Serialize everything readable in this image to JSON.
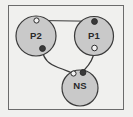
{
  "diagram": {
    "frame": {
      "x": 8.5,
      "y": 5.5,
      "width": 115,
      "height": 104,
      "stroke_color": "#6b6b6b",
      "fill_color": "#f0f0ee"
    },
    "style": {
      "node_fill": "#c9c9c9",
      "node_stroke": "#3a3a3a",
      "port_open_fill": "#f2f2f2",
      "port_filled_fill": "#3a3a3a",
      "port_stroke": "#2d2d2d",
      "edge_color": "#3a3a3a",
      "label_color": "#2a2a2a"
    },
    "nodes": [
      {
        "id": "p2",
        "label": "P2",
        "cx": 36,
        "cy": 36,
        "r": 20,
        "ports": [
          {
            "id": "p2-top-port",
            "type": "open",
            "cx": 36.5,
            "cy": 20.5,
            "r": 2.6
          },
          {
            "id": "p2-bottom-port",
            "type": "filled",
            "cx": 42.5,
            "cy": 48.5,
            "r": 2.9
          }
        ]
      },
      {
        "id": "p1",
        "label": "P1",
        "cx": 94,
        "cy": 36,
        "r": 19.5,
        "ports": [
          {
            "id": "p1-top-port",
            "type": "filled",
            "cx": 94.5,
            "cy": 21.5,
            "r": 2.9
          },
          {
            "id": "p1-bottom-port",
            "type": "open",
            "cx": 94.5,
            "cy": 48.0,
            "r": 2.8
          }
        ]
      },
      {
        "id": "ns",
        "label": "NS",
        "cx": 80,
        "cy": 88,
        "r": 18,
        "ports": [
          {
            "id": "ns-left-port",
            "type": "open",
            "cx": 73.5,
            "cy": 73.5,
            "r": 2.6
          },
          {
            "id": "ns-right-port",
            "type": "filled",
            "cx": 83.0,
            "cy": 72.5,
            "r": 2.9
          }
        ]
      }
    ],
    "edges": [
      {
        "id": "edge-p2-to-p1",
        "from": "p2-top-port",
        "to": "p1-top-port",
        "shape": "straight",
        "path": "M 39.5 20.5 L 91.5 21.3"
      },
      {
        "id": "edge-p2-to-ns",
        "from": "p2-bottom-port",
        "to": "ns-left-port",
        "shape": "curved",
        "path": "M 42.8 51.5 C 43.6 60.0 50.0 64.5 58.0 67.5 C 64.5 70.0 69.5 71.8 72.6 73.0"
      },
      {
        "id": "edge-p1-to-ns",
        "from": "p1-bottom-port",
        "to": "ns-right-port",
        "shape": "curved",
        "path": "M 94.3 50.8 C 93.6 58.5 90.0 64.0 84.5 69.8"
      }
    ]
  }
}
